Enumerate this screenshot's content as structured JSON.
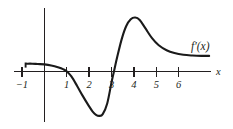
{
  "figure": {
    "background_color": "#ffffff",
    "ink_color": "#231f20",
    "curve_color": "#1a1a1a",
    "width": 233,
    "height": 129
  },
  "labels": {
    "curve_label": "f′(x)",
    "x_axis_label": "x"
  },
  "chart_data": {
    "type": "line",
    "title": "",
    "subtitle": "",
    "xlabel": "x",
    "ylabel": "",
    "grid": false,
    "legend": "none",
    "annotations": [
      {
        "text": "f′(x)",
        "x": 7.0,
        "y": 0.72,
        "role": "curve-label"
      },
      {
        "text": "x",
        "x": 7.85,
        "y": 0.0,
        "role": "axis-label"
      }
    ],
    "axis": {
      "x_axis_drawn_from": -1.35,
      "x_axis_drawn_to": 7.45,
      "y_axis_drawn": true,
      "xlim": [
        -1.4,
        7.9
      ],
      "ylim": [
        -1.95,
        1.3
      ],
      "xticks": [
        -1,
        1,
        2,
        3,
        4,
        5,
        6
      ],
      "xtick_labels": [
        "−1",
        "1",
        "2",
        "3",
        "4",
        "5",
        "6"
      ],
      "yticks": [],
      "ytick_labels": []
    },
    "series": [
      {
        "name": "f'(x)",
        "x": [
          -0.8,
          -0.55,
          -0.3,
          0.0,
          0.3,
          0.6,
          0.85,
          1.0,
          1.2,
          1.45,
          1.7,
          1.95,
          2.15,
          2.3,
          2.45,
          2.6,
          2.8,
          3.0,
          3.1,
          3.25,
          3.45,
          3.65,
          3.85,
          4.05,
          4.25,
          4.5,
          4.8,
          5.1,
          5.45,
          5.8,
          6.2,
          6.6,
          7.0,
          7.35
        ],
        "y": [
          0.22,
          0.22,
          0.21,
          0.2,
          0.17,
          0.12,
          0.06,
          0.0,
          -0.14,
          -0.4,
          -0.68,
          -0.94,
          -1.13,
          -1.22,
          -1.25,
          -1.2,
          -0.9,
          -0.28,
          0.0,
          0.42,
          0.92,
          1.28,
          1.47,
          1.52,
          1.45,
          1.22,
          0.94,
          0.74,
          0.6,
          0.52,
          0.47,
          0.45,
          0.44,
          0.44
        ],
        "key_points": {
          "left_plateau_value": 0.22,
          "zero_crossings": [
            1.0,
            3.1
          ],
          "local_minimum": {
            "x": 2.35,
            "y": -1.25
          },
          "local_maximum": {
            "x": 4.05,
            "y": 1.52
          },
          "right_asymptote_value": 0.44
        }
      }
    ]
  }
}
